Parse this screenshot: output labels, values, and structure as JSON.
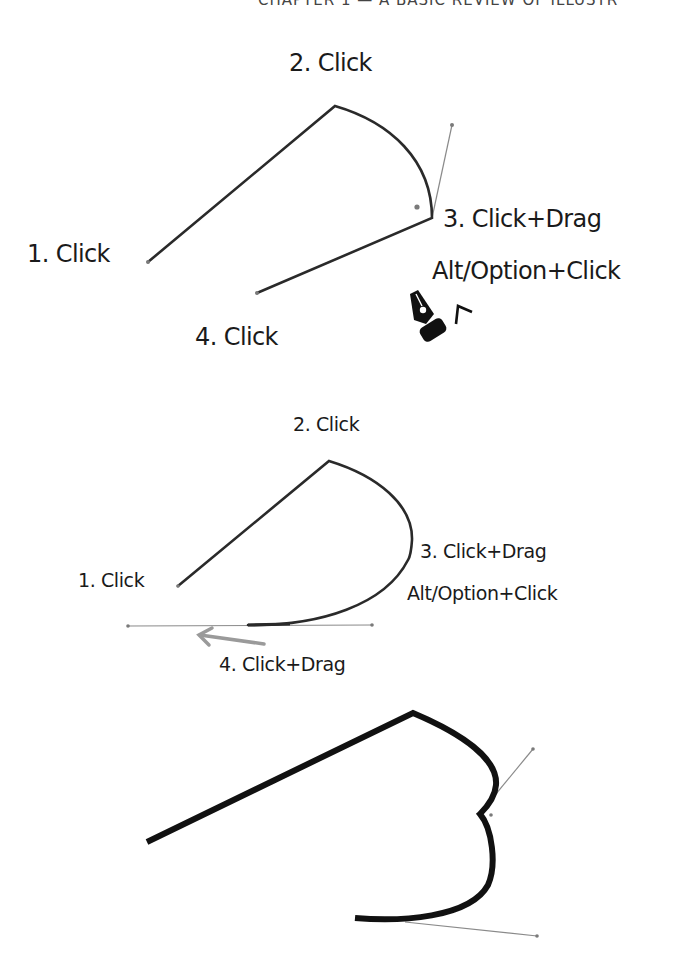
{
  "page": {
    "running_head": "CHAPTER 1 — A BASIC REVIEW OF ILLUSTR"
  },
  "figures": [
    {
      "id": "pen-tool-convert-anchor",
      "labels": {
        "step1": "1. Click",
        "step2": "2. Click",
        "step3": "3. Click+Drag",
        "step3_modifier": "Alt/Option+Click",
        "step4": "4. Click"
      },
      "icons": [
        "pen-tool-convert-cursor-icon"
      ],
      "colors": {
        "path": "#2a2a2a",
        "handle": "#8a8a8a"
      }
    },
    {
      "id": "pen-tool-smooth-end",
      "labels": {
        "step1": "1. Click",
        "step2": "2. Click",
        "step3": "3. Click+Drag",
        "step3_modifier": "Alt/Option+Click",
        "step4": "4. Click+Drag"
      },
      "icons": [
        "drag-direction-arrow-icon"
      ],
      "colors": {
        "path": "#2a2a2a",
        "handle": "#8a8a8a",
        "arrow": "#9a9a9a"
      }
    },
    {
      "id": "pen-tool-stroked-result",
      "labels": {},
      "colors": {
        "path": "#111111",
        "handle": "#8a8a8a"
      }
    }
  ]
}
